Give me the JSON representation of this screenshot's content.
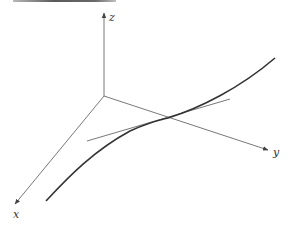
{
  "figure": {
    "type": "3d-axes-curve-with-tangent",
    "axes": {
      "origin": [
        104,
        96
      ],
      "x": {
        "label": "x",
        "end": [
          15,
          204
        ],
        "label_pos": [
          13,
          218
        ]
      },
      "y": {
        "label": "y",
        "end": [
          268,
          150
        ],
        "label_pos": [
          273,
          156
        ]
      },
      "z": {
        "label": "z",
        "end": [
          104,
          13
        ],
        "label_pos": [
          109,
          21
        ]
      }
    },
    "curve": {
      "description": "space curve",
      "path": "M46,201 C70,175 95,150 130,131 C150,122 160,120 168,118 C200,108 240,88 275,58",
      "stroke": "#333333",
      "width": 1.6
    },
    "tangent": {
      "description": "tangent line at point of contact",
      "from": [
        87,
        141
      ],
      "to": [
        230,
        99
      ],
      "stroke": "#555555",
      "width": 0.8
    },
    "colors": {
      "axis": "#555555",
      "background": "#ffffff"
    }
  }
}
